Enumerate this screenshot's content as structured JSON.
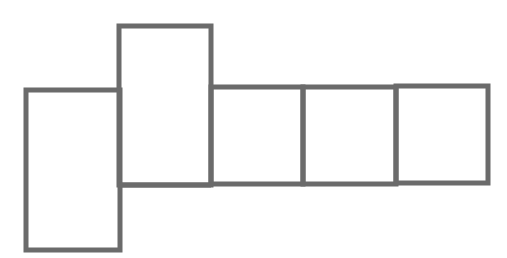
{
  "diagram": {
    "type": "cube-net",
    "stroke_color": "#6b6b6b",
    "background": "#ffffff",
    "stroke_width": 5,
    "faces": [
      {
        "id": "face-left",
        "x": 26,
        "y": 90,
        "w": 94,
        "h": 160
      },
      {
        "id": "face-raised",
        "x": 119,
        "y": 26,
        "w": 92,
        "h": 159
      },
      {
        "id": "face-row-1",
        "x": 211,
        "y": 87,
        "w": 92,
        "h": 97
      },
      {
        "id": "face-row-2",
        "x": 303,
        "y": 87,
        "w": 93,
        "h": 97
      },
      {
        "id": "face-row-3",
        "x": 396,
        "y": 86,
        "w": 92,
        "h": 97
      }
    ],
    "base_line": {
      "x1": 119,
      "y1": 185,
      "x2": 211,
      "y2": 185
    }
  }
}
